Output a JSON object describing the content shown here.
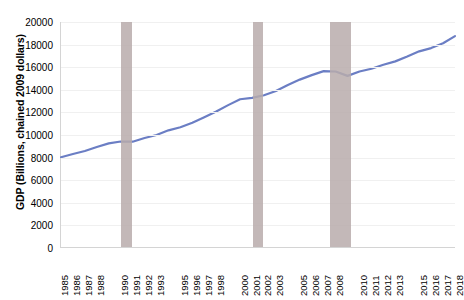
{
  "chart_data": {
    "type": "line",
    "title": "",
    "xlabel": "",
    "ylabel": "GDP (Billions, chained 2009 dollars)",
    "ylim": [
      0,
      20000
    ],
    "xlim": [
      1985,
      2018
    ],
    "grid": true,
    "legend": "none",
    "line_color": "#6b7ec4",
    "recession_color": "#b8acab",
    "y_ticks": [
      20000,
      18000,
      16000,
      14000,
      12000,
      10000,
      8000,
      6000,
      4000,
      2000,
      0
    ],
    "y_tick_labels": [
      "20000",
      "18000",
      "16000",
      "14000",
      "12000",
      "10000",
      "8000",
      "6000",
      "4000",
      "2000",
      "0"
    ],
    "x_tick_labels": [
      "1985",
      "1986",
      "1987",
      "1988",
      "1990",
      "1991",
      "1992",
      "1993",
      "1995",
      "1996",
      "1997",
      "1998",
      "2000",
      "2001",
      "2002",
      "2003",
      "2005",
      "2006",
      "2007",
      "2008",
      "2010",
      "2011",
      "2012",
      "2013",
      "2015",
      "2016",
      "2017",
      "2018"
    ],
    "x_tick_years": [
      1985,
      1986,
      1987,
      1988,
      1990,
      1991,
      1992,
      1993,
      1995,
      1996,
      1997,
      1998,
      2000,
      2001,
      2002,
      2003,
      2005,
      2006,
      2007,
      2008,
      2010,
      2011,
      2012,
      2013,
      2015,
      2016,
      2017,
      2018
    ],
    "x": [
      1985,
      1986,
      1987,
      1988,
      1989,
      1990,
      1991,
      1992,
      1993,
      1994,
      1995,
      1996,
      1997,
      1998,
      1999,
      2000,
      2001,
      2002,
      2003,
      2004,
      2005,
      2006,
      2007,
      2008,
      2009,
      2010,
      2011,
      2012,
      2013,
      2014,
      2015,
      2016,
      2017,
      2018
    ],
    "values": [
      7980,
      8270,
      8530,
      8890,
      9210,
      9380,
      9360,
      9690,
      9960,
      10370,
      10640,
      11040,
      11530,
      12040,
      12610,
      13130,
      13260,
      13490,
      13870,
      14400,
      14880,
      15280,
      15630,
      15600,
      15210,
      15600,
      15840,
      16200,
      16500,
      16930,
      17390,
      17680,
      18110,
      18750
    ],
    "series": [
      {
        "name": "Real GDP",
        "values": [
          7980,
          8270,
          8530,
          8890,
          9210,
          9380,
          9360,
          9690,
          9960,
          10370,
          10640,
          11040,
          11530,
          12040,
          12610,
          13130,
          13260,
          13490,
          13870,
          14400,
          14880,
          15280,
          15630,
          15600,
          15210,
          15600,
          15840,
          16200,
          16500,
          16930,
          17390,
          17680,
          18110,
          18750
        ]
      }
    ],
    "recessions": [
      {
        "label": "1990 recession",
        "start": 1990.0,
        "end": 1990.9
      },
      {
        "label": "2001 recession",
        "start": 2001.0,
        "end": 2001.9
      },
      {
        "label": "2007-2009 recession",
        "start": 2007.5,
        "end": 2009.2
      }
    ]
  }
}
